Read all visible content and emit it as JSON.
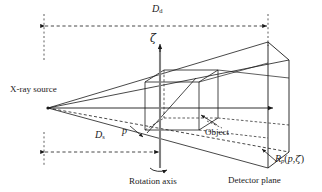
{
  "figure": {
    "type": "diagram",
    "width": 322,
    "height": 192,
    "background": "#ffffff",
    "line_color": "#1a1a1a",
    "text_color": "#1a1a1a"
  },
  "labels": {
    "source": "X-ray source",
    "object": "Object",
    "detector_plane": "Detector plane",
    "rotation_axis": "Rotation axis",
    "zeta_axis": "ζ",
    "point_p": "p",
    "distance_detector_base": "D",
    "distance_detector_sub": "d",
    "distance_source_base": "D",
    "distance_source_sub": "s",
    "projection_base": "R",
    "projection_sub": "p",
    "projection_args_open": "(",
    "projection_arg1": "p",
    "projection_comma": ",",
    "projection_arg2": "ζ",
    "projection_args_close": ")"
  },
  "elements": {
    "source_point": {
      "name": "x-ray-source-apex",
      "x": 48,
      "y": 108
    },
    "central_ray": {
      "name": "central-ray",
      "from_x": 48,
      "from_y": 108,
      "to_x": 274,
      "to_y": 108,
      "arrow": "right"
    },
    "vertical_axis": {
      "name": "zeta-axis",
      "x": 160,
      "top_y": 44,
      "bottom_y": 168,
      "arrow": "up"
    },
    "detector_quad": {
      "name": "detector-plane",
      "points": "268,42 289,60 289,152 268,168"
    },
    "object_box": {
      "name": "object-box",
      "front": "145,82 199,82 199,130 145,130"
    },
    "dim_top": {
      "name": "dimension-line-detector-distance",
      "y": 26,
      "x1": 44,
      "x2": 268
    },
    "dim_bottom": {
      "name": "dimension-line-source-distance",
      "y": 152,
      "x1": 44,
      "x2": 160
    },
    "rotation_arrow": {
      "name": "rotation-direction-arrow",
      "cx": 160,
      "cy": 166
    },
    "leader_object": {
      "name": "object-leader-arrow",
      "from_x": 213,
      "from_y": 126,
      "to_x": 198,
      "to_y": 117
    },
    "leader_projection": {
      "name": "projection-leader-arrow",
      "from_x": 272,
      "from_y": 160,
      "to_x": 258,
      "to_y": 148
    },
    "leader_p": {
      "name": "point-p-arrow",
      "from_x": 130,
      "from_y": 126,
      "to_x": 145,
      "to_y": 137
    }
  }
}
